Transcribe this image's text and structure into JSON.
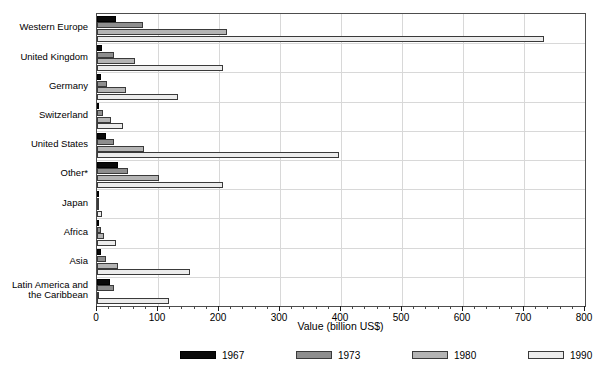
{
  "chart_data": {
    "type": "bar",
    "orientation": "horizontal",
    "title": "",
    "xlabel": "Value (billion US$)",
    "ylabel": "",
    "xlim": [
      0,
      800
    ],
    "xticks": [
      0,
      100,
      200,
      300,
      400,
      500,
      600,
      700,
      800
    ],
    "xtick_labels": [
      "0",
      "100",
      "200",
      "300",
      "400",
      "500",
      "600",
      "700",
      "800"
    ],
    "grid": "vertical-and-horizontal",
    "legend_position": "bottom",
    "categories": [
      "Western Europe",
      "United Kingdom",
      "Germany",
      "Switzerland",
      "United States",
      "Other*",
      "Japan",
      "Africa",
      "Asia",
      "Latin America and\nthe Caribbean"
    ],
    "series": [
      {
        "name": "1967",
        "color": "#0a0a0a",
        "values": [
          31,
          8,
          7,
          2,
          15,
          35,
          1,
          3,
          7,
          22
        ]
      },
      {
        "name": "1973",
        "color": "#8e8e8e",
        "values": [
          75,
          28,
          17,
          10,
          28,
          51,
          1,
          7,
          15,
          28
        ]
      },
      {
        "name": "1980",
        "color": "#b4b4b4",
        "values": [
          213,
          62,
          48,
          23,
          77,
          102,
          2,
          11,
          35,
          4
        ]
      },
      {
        "name": "1990",
        "color": "#ececec",
        "values": [
          732,
          207,
          133,
          42,
          396,
          207,
          8,
          31,
          152,
          118
        ]
      }
    ]
  },
  "legend": {
    "items": [
      {
        "label": "1967"
      },
      {
        "label": "1973"
      },
      {
        "label": "1980"
      },
      {
        "label": "1990"
      }
    ]
  },
  "axis": {
    "xlabel": "Value (billion US$)"
  }
}
